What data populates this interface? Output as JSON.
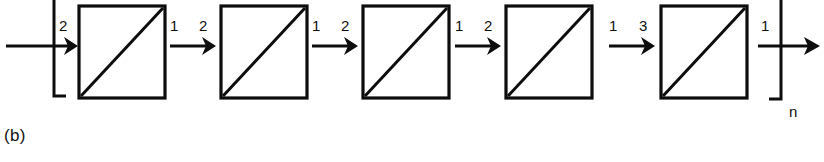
{
  "figure": {
    "caption": "(b)",
    "repeat_subscript": "n",
    "ink_color": "#0d0d0d",
    "background_color": "#ffffff",
    "stage_count": 5,
    "description_kind": "cascade-of-boxes-with-diagonals"
  },
  "input": {
    "bracket": "open-bracket",
    "arrow_label": "2",
    "arrow_name": "input-arrow"
  },
  "stages": [
    {
      "index": 1,
      "name": "stage-box-1",
      "diagonal": "bottom-left-to-top-right"
    },
    {
      "index": 2,
      "name": "stage-box-2",
      "diagonal": "bottom-left-to-top-right"
    },
    {
      "index": 3,
      "name": "stage-box-3",
      "diagonal": "bottom-left-to-top-right"
    },
    {
      "index": 4,
      "name": "stage-box-4",
      "diagonal": "bottom-left-to-top-right"
    },
    {
      "index": 5,
      "name": "stage-box-5",
      "diagonal": "bottom-left-to-top-right"
    }
  ],
  "connectors": [
    {
      "index": 1,
      "left_label": "1",
      "right_label": "2"
    },
    {
      "index": 2,
      "left_label": "1",
      "right_label": "2"
    },
    {
      "index": 3,
      "left_label": "1",
      "right_label": "2"
    },
    {
      "index": 4,
      "left_label": "1",
      "right_label": "3"
    }
  ],
  "output": {
    "bracket": "close-bracket",
    "arrow_label": "1",
    "subscript": "n",
    "arrow_name": "output-arrow"
  }
}
